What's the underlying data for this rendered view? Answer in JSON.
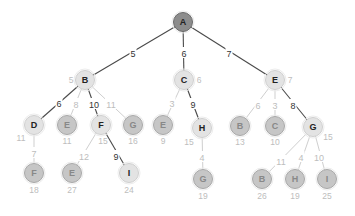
{
  "diagram": {
    "type": "search-tree",
    "colors": {
      "edge_dark": "#4a4a4a",
      "edge_light": "#cfcfcf",
      "label_dark": "#333333",
      "label_light": "#bdbdbd",
      "node_root_fill": "#8c8c8c",
      "node_root_stroke": "#6a6a6a",
      "node_light_fill": "#e3e3e3",
      "node_light_stroke": "#cfcfcf",
      "node_mid_fill": "#c6c6c6",
      "node_mid_stroke": "#a8a8a8"
    },
    "nodes": [
      {
        "id": "n0",
        "label": "A",
        "x": 183,
        "y": 22,
        "style": "root",
        "cost": "",
        "cost_dx": 0,
        "cost_dy": 0
      },
      {
        "id": "n1",
        "label": "B",
        "x": 85,
        "y": 80,
        "style": "light",
        "cost": "5",
        "cost_dx": -14,
        "cost_dy": 0
      },
      {
        "id": "n2",
        "label": "C",
        "x": 184,
        "y": 80,
        "style": "light",
        "cost": "6",
        "cost_dx": 15,
        "cost_dy": 0
      },
      {
        "id": "n3",
        "label": "E",
        "x": 275,
        "y": 80,
        "style": "light",
        "cost": "7",
        "cost_dx": 15,
        "cost_dy": 0
      },
      {
        "id": "n4",
        "label": "D",
        "x": 34,
        "y": 125,
        "style": "light",
        "cost": "11",
        "cost_dx": -13,
        "cost_dy": 13
      },
      {
        "id": "n5",
        "label": "E",
        "x": 67,
        "y": 125,
        "style": "mid",
        "cost": "11",
        "cost_dx": 0,
        "cost_dy": 16
      },
      {
        "id": "n6",
        "label": "F",
        "x": 101,
        "y": 125,
        "style": "light",
        "cost": "15",
        "cost_dx": 2,
        "cost_dy": 16
      },
      {
        "id": "n7",
        "label": "G",
        "x": 133,
        "y": 125,
        "style": "mid",
        "cost": "16",
        "cost_dx": 0,
        "cost_dy": 16
      },
      {
        "id": "n8",
        "label": "E",
        "x": 163,
        "y": 125,
        "style": "mid",
        "cost": "9",
        "cost_dx": 0,
        "cost_dy": 16
      },
      {
        "id": "n9",
        "label": "H",
        "x": 202,
        "y": 128,
        "style": "light",
        "cost": "15",
        "cost_dx": -13,
        "cost_dy": 14
      },
      {
        "id": "n10",
        "label": "B",
        "x": 240,
        "y": 126,
        "style": "mid",
        "cost": "13",
        "cost_dx": 0,
        "cost_dy": 16
      },
      {
        "id": "n11",
        "label": "C",
        "x": 275,
        "y": 126,
        "style": "mid",
        "cost": "10",
        "cost_dx": 0,
        "cost_dy": 16
      },
      {
        "id": "n12",
        "label": "G",
        "x": 313,
        "y": 127,
        "style": "light",
        "cost": "15",
        "cost_dx": 15,
        "cost_dy": 10
      },
      {
        "id": "n13",
        "label": "F",
        "x": 34,
        "y": 173,
        "style": "mid",
        "cost": "18",
        "cost_dx": 0,
        "cost_dy": 17
      },
      {
        "id": "n14",
        "label": "E",
        "x": 72,
        "y": 173,
        "style": "mid",
        "cost": "27",
        "cost_dx": 0,
        "cost_dy": 17
      },
      {
        "id": "n15",
        "label": "I",
        "x": 129,
        "y": 173,
        "style": "light",
        "cost": "24",
        "cost_dx": 0,
        "cost_dy": 17
      },
      {
        "id": "n16",
        "label": "G",
        "x": 203,
        "y": 179,
        "style": "mid",
        "cost": "19",
        "cost_dx": 0,
        "cost_dy": 17
      },
      {
        "id": "n17",
        "label": "B",
        "x": 262,
        "y": 179,
        "style": "mid",
        "cost": "26",
        "cost_dx": 0,
        "cost_dy": 17
      },
      {
        "id": "n18",
        "label": "H",
        "x": 295,
        "y": 179,
        "style": "mid",
        "cost": "19",
        "cost_dx": 0,
        "cost_dy": 17
      },
      {
        "id": "n19",
        "label": "I",
        "x": 327,
        "y": 179,
        "style": "mid",
        "cost": "25",
        "cost_dx": 0,
        "cost_dy": 17
      }
    ],
    "edges": [
      {
        "from": "n0",
        "to": "n1",
        "weight": "5",
        "style": "dark",
        "lx": 133,
        "ly": 53
      },
      {
        "from": "n0",
        "to": "n2",
        "weight": "6",
        "style": "dark",
        "lx": 184,
        "ly": 53
      },
      {
        "from": "n0",
        "to": "n3",
        "weight": "7",
        "style": "dark",
        "lx": 229,
        "ly": 53
      },
      {
        "from": "n1",
        "to": "n4",
        "weight": "6",
        "style": "dark",
        "lx": 59,
        "ly": 103
      },
      {
        "from": "n1",
        "to": "n5",
        "weight": "8",
        "style": "light",
        "lx": 76,
        "ly": 104
      },
      {
        "from": "n1",
        "to": "n6",
        "weight": "10",
        "style": "dark",
        "lx": 94,
        "ly": 104
      },
      {
        "from": "n1",
        "to": "n7",
        "weight": "11",
        "style": "light",
        "lx": 111,
        "ly": 104
      },
      {
        "from": "n2",
        "to": "n8",
        "weight": "3",
        "style": "light",
        "lx": 172,
        "ly": 103
      },
      {
        "from": "n2",
        "to": "n9",
        "weight": "9",
        "style": "dark",
        "lx": 193,
        "ly": 104
      },
      {
        "from": "n3",
        "to": "n10",
        "weight": "6",
        "style": "light",
        "lx": 258,
        "ly": 105
      },
      {
        "from": "n3",
        "to": "n11",
        "weight": "3",
        "style": "light",
        "lx": 275,
        "ly": 105
      },
      {
        "from": "n3",
        "to": "n12",
        "weight": "8",
        "style": "dark",
        "lx": 293,
        "ly": 105
      },
      {
        "from": "n4",
        "to": "n13",
        "weight": "7",
        "style": "light",
        "lx": 34,
        "ly": 153
      },
      {
        "from": "n6",
        "to": "n14",
        "weight": "12",
        "style": "light",
        "lx": 84,
        "ly": 156
      },
      {
        "from": "n6",
        "to": "n15",
        "weight": "9",
        "style": "dark",
        "lx": 116,
        "ly": 156
      },
      {
        "from": "n9",
        "to": "n16",
        "weight": "4",
        "style": "light",
        "lx": 202,
        "ly": 157
      },
      {
        "from": "n12",
        "to": "n17",
        "weight": "11",
        "style": "light",
        "lx": 281,
        "ly": 161
      },
      {
        "from": "n12",
        "to": "n18",
        "weight": "4",
        "style": "light",
        "lx": 301,
        "ly": 157
      },
      {
        "from": "n12",
        "to": "n19",
        "weight": "10",
        "style": "light",
        "lx": 319,
        "ly": 157
      }
    ]
  }
}
